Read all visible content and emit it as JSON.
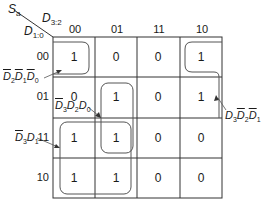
{
  "output_label": {
    "main": "S",
    "sub": "a"
  },
  "col_var": {
    "main": "D",
    "sub": "3:2"
  },
  "row_var": {
    "main": "D",
    "sub": "1:0"
  },
  "columns": [
    "00",
    "01",
    "11",
    "10"
  ],
  "rows": [
    "00",
    "01",
    "11",
    "10"
  ],
  "cells": [
    [
      "1",
      "0",
      "0",
      "1"
    ],
    [
      "0",
      "1",
      "0",
      "1"
    ],
    [
      "1",
      "1",
      "0",
      "0"
    ],
    [
      "1",
      "1",
      "0",
      "0"
    ]
  ],
  "groups": [
    {
      "id": "g1",
      "term": "D2' D1' D0'",
      "parts": [
        {
          "v": "D",
          "s": "2",
          "bar": true
        },
        {
          "v": "D",
          "s": "1",
          "bar": true
        },
        {
          "v": "D",
          "s": "0",
          "bar": true
        }
      ]
    },
    {
      "id": "g2",
      "term": "D3' D2 D0",
      "parts": [
        {
          "v": "D",
          "s": "3",
          "bar": true
        },
        {
          "v": "D",
          "s": "2",
          "bar": false
        },
        {
          "v": "D",
          "s": "0",
          "bar": false
        }
      ]
    },
    {
      "id": "g3",
      "term": "D3 D2' D1'",
      "parts": [
        {
          "v": "D",
          "s": "3",
          "bar": false
        },
        {
          "v": "D",
          "s": "2",
          "bar": true
        },
        {
          "v": "D",
          "s": "1",
          "bar": true
        }
      ]
    },
    {
      "id": "g4",
      "term": "D3' D1",
      "parts": [
        {
          "v": "D",
          "s": "3",
          "bar": true
        },
        {
          "v": "D",
          "s": "1",
          "bar": false
        }
      ]
    }
  ]
}
